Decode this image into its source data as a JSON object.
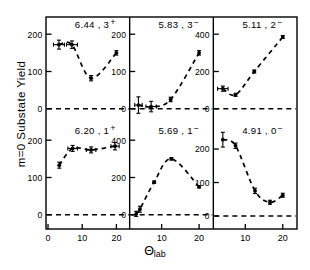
{
  "figure": {
    "ylabel": "m=0  Substate  Yield",
    "xlabel_main": "Θ",
    "xlabel_sub": "lab"
  },
  "chart_data": {
    "type": "scatter",
    "title": "",
    "xlabel": "Θ_lab",
    "ylabel": "m=0 Substate Yield",
    "grid": false,
    "legend": "none",
    "layout": "2 rows x 3 columns of panels, shared x-axis, dashed zero reference line in each panel, dashed curve through points",
    "panels": [
      {
        "id": "panel-1",
        "row": 0,
        "col": 0,
        "label": "6.44 , 3",
        "superscript": "+",
        "energy_mev": 6.44,
        "spin_parity": "3+",
        "xlim": [
          0,
          23
        ],
        "ylim": [
          -30,
          230
        ],
        "yticks": [
          0,
          100,
          200
        ],
        "ytick_labels": [
          "0",
          "100",
          "200"
        ],
        "ytick_side": "left",
        "xticks": [
          0,
          10,
          20
        ],
        "xtick_labels": [
          "0",
          "10",
          "20"
        ],
        "zero_line": 0,
        "x": [
          3.2,
          7.0,
          12.6,
          20.0
        ],
        "y": [
          172,
          172,
          82,
          150
        ],
        "yerr": [
          12,
          10,
          7,
          6
        ],
        "xerr": [
          1.6,
          1.6,
          0,
          0
        ]
      },
      {
        "id": "panel-2",
        "row": 0,
        "col": 1,
        "label": "5.83 , 3",
        "superscript": "−",
        "energy_mev": 5.83,
        "spin_parity": "3-",
        "xlim": [
          2,
          23
        ],
        "ylim": [
          -30,
          230
        ],
        "yticks": [
          0,
          100,
          200
        ],
        "ytick_labels": [
          "0",
          "100",
          "200"
        ],
        "ytick_side": "left",
        "xticks": [
          10,
          20
        ],
        "xtick_labels": [
          "10",
          "20"
        ],
        "zero_line": 0,
        "x": [
          3.8,
          7.2,
          12.4,
          20.0
        ],
        "y": [
          10,
          6,
          25,
          150
        ],
        "yerr": [
          22,
          14,
          6,
          6
        ],
        "xerr": [
          1.0,
          1.4,
          0,
          0
        ]
      },
      {
        "id": "panel-3",
        "row": 0,
        "col": 2,
        "label": "5.11 , 2",
        "superscript": "−",
        "energy_mev": 5.11,
        "spin_parity": "2-",
        "xlim": [
          2,
          23
        ],
        "ylim": [
          -60,
          460
        ],
        "yticks": [
          0,
          200,
          400
        ],
        "ytick_labels": [
          "0",
          "200",
          "400"
        ],
        "ytick_side": "left",
        "xticks": [
          10,
          20
        ],
        "xtick_labels": [
          "10",
          "20"
        ],
        "zero_line": 0,
        "x": [
          4.0,
          7.4,
          12.4,
          20.0
        ],
        "y": [
          108,
          75,
          200,
          385
        ],
        "yerr": [
          14,
          8,
          8,
          8
        ],
        "xerr": [
          1.4,
          0,
          0,
          0
        ]
      },
      {
        "id": "panel-4",
        "row": 1,
        "col": 0,
        "label": "6.20 , 1",
        "superscript": "+",
        "energy_mev": 6.2,
        "spin_parity": "1+",
        "xlim": [
          0,
          23
        ],
        "ylim": [
          -30,
          230
        ],
        "yticks": [
          0,
          100,
          200
        ],
        "ytick_labels": [
          "0",
          "100",
          "200"
        ],
        "ytick_side": "left",
        "xticks": [
          0,
          10,
          20
        ],
        "xtick_labels": [
          "0",
          "10",
          "20"
        ],
        "zero_line": 0,
        "x": [
          3.3,
          7.2,
          12.6,
          19.6
        ],
        "y": [
          133,
          178,
          174,
          184
        ],
        "yerr": [
          8,
          8,
          8,
          10
        ],
        "xerr": [
          0,
          1.4,
          1.4,
          1.2
        ]
      },
      {
        "id": "panel-5",
        "row": 1,
        "col": 1,
        "label": "5.69 , 1",
        "superscript": "−",
        "energy_mev": 5.69,
        "spin_parity": "1-",
        "xlim": [
          2,
          23
        ],
        "ylim": [
          -60,
          460
        ],
        "yticks": [
          0,
          200,
          400
        ],
        "ytick_labels": [
          "0",
          "200",
          "400"
        ],
        "ytick_side": "left",
        "xticks": [
          10,
          20
        ],
        "xtick_labels": [
          "10",
          "20"
        ],
        "zero_line": 0,
        "x": [
          3.2,
          4.2,
          8.0,
          12.6,
          20.0
        ],
        "y": [
          5,
          30,
          175,
          300,
          150
        ],
        "yerr": [
          14,
          16,
          6,
          6,
          6
        ],
        "xerr": [
          0,
          0,
          0,
          0,
          0
        ]
      },
      {
        "id": "panel-6",
        "row": 1,
        "col": 2,
        "label": "4.91 , 0",
        "superscript": "−",
        "energy_mev": 4.91,
        "spin_parity": "0-",
        "xlim": [
          2,
          23
        ],
        "ylim": [
          -30,
          260
        ],
        "yticks": [
          0,
          100,
          200
        ],
        "ytick_labels": [
          "0",
          "100",
          "200"
        ],
        "ytick_side": "left",
        "xticks": [
          10,
          20
        ],
        "xtick_labels": [
          "10",
          "20"
        ],
        "zero_line": 0,
        "x": [
          4.0,
          7.4,
          12.6,
          16.6,
          20.0
        ],
        "y": [
          228,
          210,
          75,
          41,
          62
        ],
        "yerr": [
          22,
          8,
          8,
          6,
          6
        ],
        "xerr": [
          0,
          0,
          0,
          0,
          0
        ]
      }
    ]
  }
}
